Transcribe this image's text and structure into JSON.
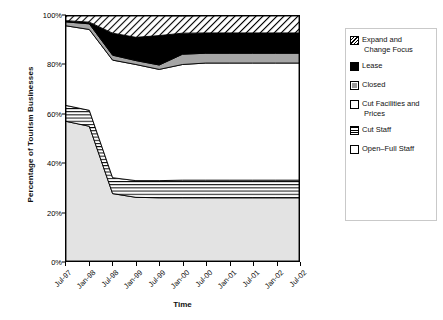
{
  "chart_data": {
    "type": "area",
    "title": "",
    "xlabel": "Time",
    "ylabel": "Percentage of Tourism Businesses",
    "stacked": true,
    "normalized_percent": true,
    "grid": false,
    "legend_position": "right",
    "ylim": [
      0,
      100
    ],
    "ytick_labels": [
      "0%",
      "20%",
      "40%",
      "60%",
      "80%",
      "100%"
    ],
    "ytick_values": [
      0,
      20,
      40,
      60,
      80,
      100
    ],
    "categories": [
      "Jul-97",
      "Jan-98",
      "Jul-98",
      "Jan-99",
      "Jul-99",
      "Jan-00",
      "Jul-00",
      "Jan-01",
      "Jul-01",
      "Jan-02",
      "Jul-02"
    ],
    "series": [
      {
        "name": "Open-Full Staff",
        "pattern": "solid-light-gray",
        "color": "#e0e0e0",
        "values": [
          57.0,
          55.0,
          27.5,
          26.0,
          25.8,
          25.8,
          25.8,
          25.8,
          25.8,
          25.8,
          25.8
        ]
      },
      {
        "name": "Cut Staff",
        "pattern": "horizontal-lines",
        "color": "#ffffff",
        "values": [
          6.5,
          6.5,
          6.5,
          6.8,
          7.0,
          7.2,
          7.2,
          7.2,
          7.2,
          7.2,
          7.2
        ]
      },
      {
        "name": "Cut Facilities and Prices",
        "pattern": "solid-white",
        "color": "#ffffff",
        "values": [
          32.5,
          33.0,
          48.0,
          47.4,
          45.4,
          47.2,
          47.8,
          47.8,
          47.8,
          47.8,
          47.8
        ]
      },
      {
        "name": "Closed",
        "pattern": "solid-gray",
        "color": "#a8a8a8",
        "values": [
          1.6,
          2.3,
          2.0,
          1.6,
          1.8,
          4.2,
          4.0,
          4.0,
          4.0,
          4.0,
          4.0
        ]
      },
      {
        "name": "Lease",
        "pattern": "solid-black",
        "color": "#000000",
        "values": [
          0.5,
          0.7,
          9.0,
          9.5,
          12.0,
          8.6,
          8.3,
          8.3,
          8.3,
          8.3,
          8.3
        ]
      },
      {
        "name": "Expand and Change Focus",
        "pattern": "diagonal-hatch",
        "color": "#ffffff",
        "values": [
          1.9,
          2.5,
          7.0,
          8.7,
          8.0,
          6.9,
          6.9,
          6.9,
          6.9,
          6.9,
          6.9
        ]
      }
    ],
    "legend_entries": [
      {
        "label_line1": "Expand and",
        "label_line2": "Change Focus",
        "pattern": "diagonal-hatch"
      },
      {
        "label_line1": "Lease",
        "label_line2": "",
        "pattern": "solid-black"
      },
      {
        "label_line1": "Closed",
        "label_line2": "",
        "pattern": "solid-gray"
      },
      {
        "label_line1": "Cut Facilities and",
        "label_line2": "Prices",
        "pattern": "solid-white"
      },
      {
        "label_line1": "Cut Staff",
        "label_line2": "",
        "pattern": "horizontal-lines"
      },
      {
        "label_line1": "Open–Full Staff",
        "label_line2": "",
        "pattern": "solid-light-gray"
      }
    ]
  }
}
